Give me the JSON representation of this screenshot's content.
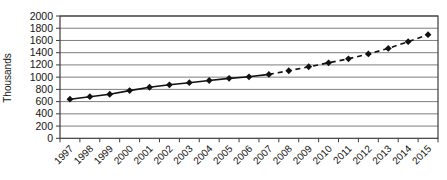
{
  "figure": {
    "background": "#ffffff"
  },
  "chart_data": {
    "type": "line",
    "title": "",
    "xlabel": "",
    "ylabel": "Thousands",
    "categories": [
      "1997",
      "1998",
      "1999",
      "2000",
      "2001",
      "2002",
      "2003",
      "2004",
      "2005",
      "2006",
      "2007",
      "2008",
      "2009",
      "2010",
      "2011",
      "2012",
      "2013",
      "2014",
      "2015"
    ],
    "series": [
      {
        "name": "Thousands",
        "values": [
          640,
          680,
          720,
          780,
          835,
          875,
          910,
          945,
          980,
          1005,
          1045,
          1105,
          1170,
          1235,
          1300,
          1380,
          1470,
          1580,
          1695
        ],
        "marker": "diamond",
        "color": "#111111",
        "dashed_from_category": "2007",
        "dashed_note": "line is solid 1997-2007, dashed (projection) 2007-2015"
      }
    ],
    "ylim": [
      0,
      2000
    ],
    "ytick_step": 200,
    "yticks": [
      0,
      200,
      400,
      600,
      800,
      1000,
      1200,
      1400,
      1600,
      1800,
      2000
    ],
    "grid": "horizontal",
    "legend": false,
    "x_tick_rotation_deg": -45,
    "colors": {
      "grid": "#7d7d7d",
      "axis": "#3c3c3c",
      "tick_label": "#151515",
      "line": "#111111"
    }
  }
}
